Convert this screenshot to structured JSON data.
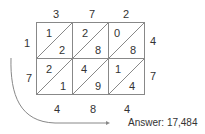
{
  "top_digits": [
    "3",
    "7",
    "2"
  ],
  "right_digits": [
    "4",
    "7"
  ],
  "left_digits": [
    "1",
    "7"
  ],
  "bottom_digits": [
    "4",
    "8",
    "4"
  ],
  "cells": [
    [
      {
        "tens": "1",
        "ones": "2"
      },
      {
        "tens": "2",
        "ones": "8"
      },
      {
        "tens": "0",
        "ones": "8"
      }
    ],
    [
      {
        "tens": "2",
        "ones": "1"
      },
      {
        "tens": "4",
        "ones": "9"
      },
      {
        "tens": "1",
        "ones": "4"
      }
    ]
  ],
  "answer_label": "Answer: 17,484",
  "colors": {
    "line": "#888888",
    "text": "#333333"
  }
}
